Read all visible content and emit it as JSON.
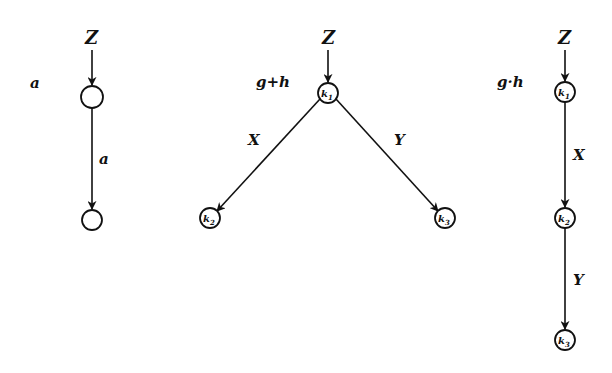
{
  "diagrams": [
    {
      "id": "a",
      "label": "a",
      "input": "Z",
      "nodes": [
        {
          "id": "n1",
          "label": ""
        },
        {
          "id": "n2",
          "label": ""
        }
      ],
      "edges": [
        {
          "from": "Z",
          "to": "n1",
          "label": ""
        },
        {
          "from": "n1",
          "to": "n2",
          "label": "a"
        }
      ]
    },
    {
      "id": "g_plus_h",
      "label": "g+h",
      "input": "Z",
      "nodes": [
        {
          "id": "k1",
          "base": "k",
          "sub": "1"
        },
        {
          "id": "k2",
          "base": "k",
          "sub": "2"
        },
        {
          "id": "k3",
          "base": "k",
          "sub": "3"
        }
      ],
      "edges": [
        {
          "from": "Z",
          "to": "k1",
          "label": ""
        },
        {
          "from": "k1",
          "to": "k2",
          "label": "X"
        },
        {
          "from": "k1",
          "to": "k3",
          "label": "Y"
        }
      ]
    },
    {
      "id": "g_dot_h",
      "label": "g·h",
      "input": "Z",
      "nodes": [
        {
          "id": "k1",
          "base": "k",
          "sub": "1"
        },
        {
          "id": "k2",
          "base": "k",
          "sub": "2"
        },
        {
          "id": "k3",
          "base": "k",
          "sub": "3"
        }
      ],
      "edges": [
        {
          "from": "Z",
          "to": "k1",
          "label": ""
        },
        {
          "from": "k1",
          "to": "k2",
          "label": "X"
        },
        {
          "from": "k2",
          "to": "k3",
          "label": "Y"
        }
      ]
    }
  ]
}
